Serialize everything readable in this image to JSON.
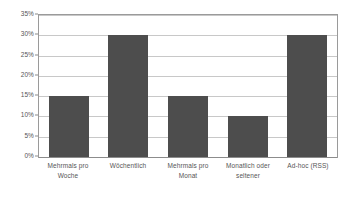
{
  "chart_data": {
    "type": "bar",
    "title": "",
    "subtitle": "",
    "xlabel": "",
    "ylabel": "",
    "categories": [
      "Mehrmals pro Woche",
      "Wöchentlich",
      "Mehrmals pro Monat",
      "Monatlich oder seltener",
      "Ad-hoc (RSS)"
    ],
    "category_lines": [
      [
        "Mehrmals pro",
        "Woche"
      ],
      [
        "Wöchentlich"
      ],
      [
        "Mehrmals pro",
        "Monat"
      ],
      [
        "Monatlich oder",
        "seltener"
      ],
      [
        "Ad-hoc (RSS)"
      ]
    ],
    "values": [
      15,
      30,
      15,
      10,
      30
    ],
    "value_labels": [
      "15%",
      "30%",
      "15%",
      "10%",
      "30%"
    ],
    "ylim": [
      0,
      35
    ],
    "ytick_values": [
      0,
      5,
      10,
      15,
      20,
      25,
      30,
      35
    ],
    "ytick_labels": [
      "0%",
      "5%",
      "10%",
      "15%",
      "20%",
      "25%",
      "30%",
      "35%"
    ],
    "grid": true,
    "legend": false,
    "legend_position": "none",
    "bar_color": "#4d4d4d",
    "gridline_color": "#c8c8c8",
    "axis_color": "#9a9a9a",
    "plot_background": "#ffffff",
    "text_color": "#555555"
  }
}
